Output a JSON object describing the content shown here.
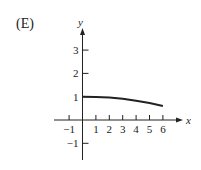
{
  "option_label": "(E)",
  "chart_data": {
    "type": "line",
    "title": "",
    "xlabel": "x",
    "ylabel": "y",
    "xlim": [
      -1.5,
      6.8
    ],
    "ylim": [
      -1.7,
      4
    ],
    "x_ticks": [
      -1,
      1,
      2,
      3,
      4,
      5,
      6
    ],
    "y_ticks": [
      -1,
      1,
      2,
      3
    ],
    "grid": false,
    "series": [
      {
        "name": "curve",
        "x": [
          0,
          1,
          2,
          3,
          4,
          5,
          6
        ],
        "values": [
          1.0,
          0.99,
          0.96,
          0.91,
          0.83,
          0.73,
          0.6
        ]
      }
    ]
  },
  "colors": {
    "ink": "#222222"
  }
}
